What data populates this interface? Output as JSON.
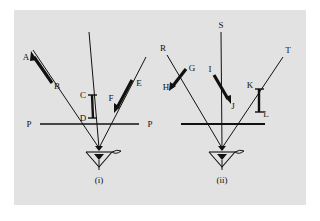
{
  "figure": {
    "background_color": "#e2e2e2",
    "page_color": "#ffffff",
    "ink_color": "#111111",
    "type": "optics-ray-diagram",
    "caption_i": "(i)",
    "caption_ii": "(ii)"
  },
  "diagram_i": {
    "caption": "(i)",
    "baseline_label_left": "P",
    "baseline_label_right": "P",
    "ray_labels": {
      "left_ray_arrow_head": "A",
      "left_ray_tail": "B",
      "center_top": "C",
      "center_bottom": "D",
      "right_ray_top": "E",
      "right_ray_arrow_head": "F"
    },
    "segments": [
      {
        "name": "AB",
        "start_label": "A",
        "end_label": "B",
        "style": "thick-arrow",
        "arrow_at": "A"
      },
      {
        "name": "CD",
        "start_label": "C",
        "end_label": "D",
        "style": "thick-capped-vertical"
      },
      {
        "name": "EF",
        "start_label": "E",
        "end_label": "F",
        "style": "thick-arrow",
        "arrow_at": "F"
      }
    ]
  },
  "diagram_ii": {
    "caption": "(ii)",
    "ray_labels": {
      "left_ray_top": "R",
      "center_ray_top": "S",
      "right_ray_top": "T",
      "left_marker_top": "G",
      "left_marker_bottom": "H",
      "center_marker_top": "I",
      "center_marker_bottom": "J",
      "right_marker_top": "K",
      "right_marker_bottom": "L"
    },
    "segments": [
      {
        "name": "GH",
        "start_label": "G",
        "end_label": "H",
        "style": "thick-arrow",
        "arrow_at": "H"
      },
      {
        "name": "IJ",
        "start_label": "I",
        "end_label": "J",
        "style": "thick-arrow",
        "arrow_at": "J"
      },
      {
        "name": "KL",
        "start_label": "K",
        "end_label": "L",
        "style": "thick-capped-vertical"
      }
    ]
  }
}
